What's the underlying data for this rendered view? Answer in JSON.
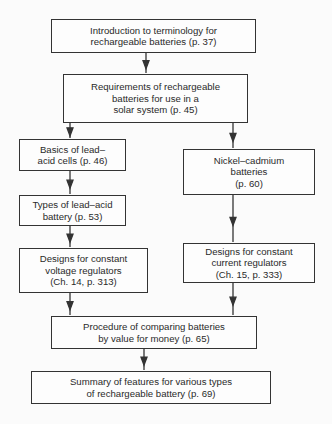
{
  "nodes": [
    {
      "id": "intro",
      "text": "Introduction to terminology for\nrechargeable batteries (p. 37)",
      "x": 51,
      "y": 19,
      "w": 205,
      "h": 34
    },
    {
      "id": "requirements",
      "text": "Requirements of rechargeable\nbatteries for use in a\nsolar system (p. 45)",
      "x": 63,
      "y": 74,
      "w": 185,
      "h": 49
    },
    {
      "id": "lead-acid-basics",
      "text": "Basics of lead–\nacid cells (p. 46)",
      "x": 19,
      "y": 139,
      "w": 107,
      "h": 32
    },
    {
      "id": "lead-acid-types",
      "text": "Types of lead–acid\nbattery (p. 53)",
      "x": 19,
      "y": 195,
      "w": 107,
      "h": 31
    },
    {
      "id": "cv-regulators",
      "text": "Designs for constant\nvoltage regulators\n(Ch. 14, p. 313)",
      "x": 19,
      "y": 248,
      "w": 129,
      "h": 45
    },
    {
      "id": "nicad",
      "text": "Nickel–cadmium\nbatteries\n(p. 60)",
      "x": 183,
      "y": 149,
      "w": 132,
      "h": 46
    },
    {
      "id": "cc-regulators",
      "text": "Designs for constant\ncurrent regulators\n(Ch. 15, p. 333)",
      "x": 183,
      "y": 243,
      "w": 132,
      "h": 40
    },
    {
      "id": "value-for-money",
      "text": "Procedure of comparing batteries\nby value for money (p. 65)",
      "x": 51,
      "y": 316,
      "w": 206,
      "h": 33
    },
    {
      "id": "summary",
      "text": "Summary of features for various types\nof rechargeable battery (p. 69)",
      "x": 31,
      "y": 371,
      "w": 240,
      "h": 33
    }
  ],
  "edges": [
    {
      "from": "intro",
      "to": "requirements",
      "x1": 146,
      "y1": 53,
      "x2": 146,
      "y2": 74
    },
    {
      "from": "requirements",
      "to": "lead-acid-basics",
      "x1": 70,
      "y1": 123,
      "x2": 70,
      "y2": 139
    },
    {
      "from": "requirements",
      "to": "nicad",
      "x1": 233,
      "y1": 123,
      "x2": 233,
      "y2": 149
    },
    {
      "from": "lead-acid-basics",
      "to": "lead-acid-types",
      "x1": 70,
      "y1": 171,
      "x2": 70,
      "y2": 195
    },
    {
      "from": "lead-acid-types",
      "to": "cv-regulators",
      "x1": 70,
      "y1": 226,
      "x2": 70,
      "y2": 248
    },
    {
      "from": "nicad",
      "to": "cc-regulators",
      "x1": 233,
      "y1": 195,
      "x2": 233,
      "y2": 243
    },
    {
      "from": "cv-regulators",
      "to": "value-for-money",
      "x1": 70,
      "y1": 293,
      "x2": 70,
      "y2": 316
    },
    {
      "from": "cc-regulators",
      "to": "value-for-money",
      "x1": 233,
      "y1": 283,
      "x2": 233,
      "y2": 316
    },
    {
      "from": "value-for-money",
      "to": "summary",
      "x1": 144,
      "y1": 349,
      "x2": 144,
      "y2": 371
    }
  ],
  "colors": {
    "line": "#333333",
    "background": "#fbfbfb"
  }
}
